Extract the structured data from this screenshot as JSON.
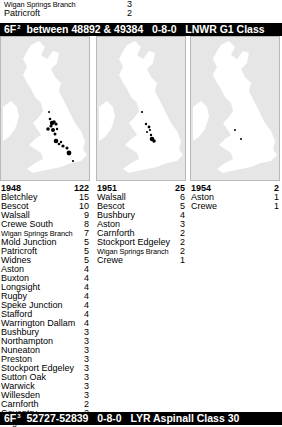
{
  "previous_section_tail": [
    {
      "name": "Wigan Springs Branch",
      "count": "3",
      "small": true
    },
    {
      "name": "Patricroft",
      "count": "2",
      "small": false
    }
  ],
  "section": {
    "class_code": "6F",
    "superscript": "2",
    "title_rest": "between 48892 & 49384   0-8-0   LNWR G1 Class"
  },
  "panels": [
    {
      "year": "1948",
      "total": "122",
      "dots": [
        {
          "x": 48,
          "y": 75,
          "r": 1
        },
        {
          "x": 49,
          "y": 82,
          "r": 1.3
        },
        {
          "x": 51,
          "y": 86,
          "r": 2.2
        },
        {
          "x": 53,
          "y": 85,
          "r": 1.8
        },
        {
          "x": 55,
          "y": 87,
          "r": 1.6
        },
        {
          "x": 50,
          "y": 89,
          "r": 1.6
        },
        {
          "x": 47,
          "y": 92,
          "r": 1.8
        },
        {
          "x": 52,
          "y": 93,
          "r": 2
        },
        {
          "x": 56,
          "y": 92,
          "r": 1.2
        },
        {
          "x": 54,
          "y": 97,
          "r": 1.5
        },
        {
          "x": 55,
          "y": 104,
          "r": 2.3
        },
        {
          "x": 58,
          "y": 107,
          "r": 1.3
        },
        {
          "x": 60,
          "y": 105,
          "r": 1.2
        },
        {
          "x": 62,
          "y": 109,
          "r": 1.6
        },
        {
          "x": 66,
          "y": 111,
          "r": 1.5
        },
        {
          "x": 68,
          "y": 116,
          "r": 2.4
        },
        {
          "x": 72,
          "y": 124,
          "r": 1.1
        }
      ],
      "rows": [
        {
          "name": "Bletchley",
          "count": "15"
        },
        {
          "name": "Bescot",
          "count": "10"
        },
        {
          "name": "Walsall",
          "count": "9"
        },
        {
          "name": "Crewe South",
          "count": "8"
        },
        {
          "name": "Wigan Springs Branch",
          "count": "7",
          "small": true
        },
        {
          "name": "Mold Junction",
          "count": "5"
        },
        {
          "name": "Patricroft",
          "count": "5"
        },
        {
          "name": "Widnes",
          "count": "5"
        },
        {
          "name": "Aston",
          "count": "4"
        },
        {
          "name": "Buxton",
          "count": "4"
        },
        {
          "name": "Longsight",
          "count": "4"
        },
        {
          "name": "Rugby",
          "count": "4"
        },
        {
          "name": "Speke Junction",
          "count": "4"
        },
        {
          "name": "Stafford",
          "count": "4"
        },
        {
          "name": "Warrington Dallam",
          "count": "4"
        },
        {
          "name": "Bushbury",
          "count": "3"
        },
        {
          "name": "Northampton",
          "count": "3"
        },
        {
          "name": "Nuneaton",
          "count": "3"
        },
        {
          "name": "Preston",
          "count": "3"
        },
        {
          "name": "Stockport Edgeley",
          "count": "3"
        },
        {
          "name": "Sutton Oak",
          "count": "3"
        },
        {
          "name": "Warwick",
          "count": "3"
        },
        {
          "name": "Willesden",
          "count": "3"
        },
        {
          "name": "Carnforth",
          "count": "2"
        },
        {
          "name": "Coventry",
          "count": "2"
        },
        {
          "name": "Edge Hill",
          "count": "2"
        }
      ]
    },
    {
      "year": "1951",
      "total": "25",
      "dots": [
        {
          "x": 45,
          "y": 75,
          "r": 1.1
        },
        {
          "x": 49,
          "y": 87,
          "r": 1.2
        },
        {
          "x": 52,
          "y": 90,
          "r": 1.4
        },
        {
          "x": 53,
          "y": 93,
          "r": 1.1
        },
        {
          "x": 50,
          "y": 95,
          "r": 1
        },
        {
          "x": 54,
          "y": 98,
          "r": 1.2
        },
        {
          "x": 55,
          "y": 102,
          "r": 2.3
        },
        {
          "x": 57,
          "y": 104,
          "r": 1.8
        }
      ],
      "rows": [
        {
          "name": "Walsall",
          "count": "6"
        },
        {
          "name": "Bescot",
          "count": "5"
        },
        {
          "name": "Bushbury",
          "count": "4"
        },
        {
          "name": "Aston",
          "count": "3"
        },
        {
          "name": "Carnforth",
          "count": "2"
        },
        {
          "name": "Stockport Edgeley",
          "count": "2"
        },
        {
          "name": "Wigan Springs Branch",
          "count": "2",
          "small": true
        },
        {
          "name": "Crewe",
          "count": "1"
        }
      ]
    },
    {
      "year": "1954",
      "total": "2",
      "dots": [
        {
          "x": 44,
          "y": 93,
          "r": 1
        },
        {
          "x": 50,
          "y": 102,
          "r": 1
        }
      ],
      "rows": [
        {
          "name": "Aston",
          "count": "1"
        },
        {
          "name": "Crewe",
          "count": "1"
        }
      ]
    }
  ],
  "next_section": {
    "class_code": "6F",
    "superscript": "3",
    "title_rest": "52727-52839   0-8-0   LYR Aspinall Class 30"
  },
  "colors": {
    "bar": "#000000",
    "bar_text": "#ffffff",
    "sea": "#e6e6e6",
    "land": "#ffffff",
    "dot": "#000000"
  }
}
